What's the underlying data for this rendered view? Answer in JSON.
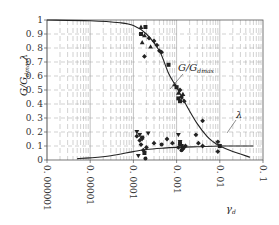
{
  "chart_data": {
    "type": "scatter",
    "title": "",
    "xlabel": "γd",
    "ylabel": "G/Gdmax, λ",
    "xscale": "log",
    "xlim": [
      1e-06,
      0.1
    ],
    "ylim": [
      0,
      1
    ],
    "grid": true,
    "x_ticks": [
      "0.000001",
      "0.00001",
      "0.0001",
      "0.001",
      "0.01",
      "0.1"
    ],
    "y_ticks": [
      "0",
      "0.1",
      "0.2",
      "0.3",
      "0.4",
      "0.5",
      "0.6",
      "0.7",
      "0.8",
      "0.9",
      "1"
    ],
    "annotations": [
      {
        "text": "G/Gdmax",
        "target": "G/Gdmax curve"
      },
      {
        "text": "λ",
        "target": "λ curve"
      }
    ],
    "series": [
      {
        "name": "G/Gdmax fitted curve",
        "kind": "line",
        "x": [
          1e-06,
          1e-05,
          5e-05,
          0.0001,
          0.0002,
          0.0004,
          0.00065,
          0.001,
          0.0015,
          0.002,
          0.003,
          0.005,
          0.007,
          0.01,
          0.02,
          0.05
        ],
        "y": [
          1.0,
          0.995,
          0.98,
          0.96,
          0.9,
          0.78,
          0.62,
          0.52,
          0.42,
          0.35,
          0.26,
          0.17,
          0.13,
          0.1,
          0.06,
          0.02
        ]
      },
      {
        "name": "λ fitted curve",
        "kind": "line",
        "x": [
          5e-06,
          1e-05,
          3e-05,
          0.0001,
          0.0002,
          0.0005,
          0.001,
          0.003,
          0.01,
          0.03,
          0.06
        ],
        "y": [
          0.01,
          0.015,
          0.03,
          0.06,
          0.075,
          0.085,
          0.09,
          0.095,
          0.1,
          0.1,
          0.1
        ]
      },
      {
        "name": "G/Gdmax triangles",
        "marker": "triangle-up",
        "x": [
          0.00015,
          0.00016,
          0.00025,
          0.00018,
          0.0009,
          0.0011,
          0.0014
        ],
        "y": [
          0.95,
          0.84,
          0.81,
          0.89,
          0.54,
          0.48,
          0.47
        ]
      },
      {
        "name": "G/Gdmax squares",
        "marker": "square",
        "x": [
          0.00019,
          0.00015,
          0.00065,
          0.001,
          0.0011,
          0.0012,
          0.01
        ],
        "y": [
          0.95,
          0.9,
          0.68,
          0.52,
          0.44,
          0.42,
          0.1
        ]
      },
      {
        "name": "G/Gdmax diamonds",
        "marker": "diamond",
        "x": [
          0.00023,
          0.0003,
          0.00035,
          0.00018,
          0.0004,
          0.00045,
          0.0012,
          0.0013,
          0.0015,
          0.004,
          0.009
        ],
        "y": [
          0.87,
          0.85,
          0.82,
          0.74,
          0.78,
          0.77,
          0.5,
          0.45,
          0.42,
          0.28,
          0.06
        ]
      },
      {
        "name": "λ inverted triangles",
        "marker": "triangle-down",
        "x": [
          0.00012,
          0.00014,
          0.00016,
          0.00022,
          0.0011,
          0.0012,
          0.0013,
          0.00013
        ],
        "y": [
          0.2,
          0.18,
          0.15,
          0.19,
          0.18,
          0.13,
          0.1,
          0.03
        ]
      },
      {
        "name": "λ diamonds",
        "marker": "diamond",
        "x": [
          0.00012,
          0.00014,
          0.00015,
          0.00017,
          0.0002,
          0.0003,
          0.0006,
          0.0008,
          0.0011,
          0.0012,
          0.0014,
          0.0016,
          0.0028,
          0.0032,
          0.004,
          0.009
        ],
        "y": [
          0.17,
          0.14,
          0.11,
          0.07,
          0.09,
          0.12,
          0.15,
          0.12,
          0.09,
          0.11,
          0.08,
          0.1,
          0.18,
          0.12,
          0.1,
          0.13
        ]
      },
      {
        "name": "λ squares",
        "marker": "square",
        "x": [
          0.00016,
          0.00018,
          0.0012,
          0.0014
        ],
        "y": [
          0.16,
          0.05,
          0.12,
          0.09
        ]
      },
      {
        "name": "λ circles",
        "marker": "circle",
        "x": [
          0.00019,
          0.00045,
          0.0013
        ],
        "y": [
          0.01,
          0.11,
          0.07
        ]
      }
    ]
  },
  "labels": {
    "ylabel_main": "G/G",
    "ylabel_sub": "dmax",
    "ylabel_lambda": "λ",
    "xlabel_main": "γ",
    "xlabel_sub": "d",
    "annot_g_main": "G/G",
    "annot_g_sub": "dmax",
    "annot_lambda": "λ"
  },
  "colors": {
    "ink": "#222222",
    "grid": "#9a9a9a",
    "background": "#ffffff"
  }
}
